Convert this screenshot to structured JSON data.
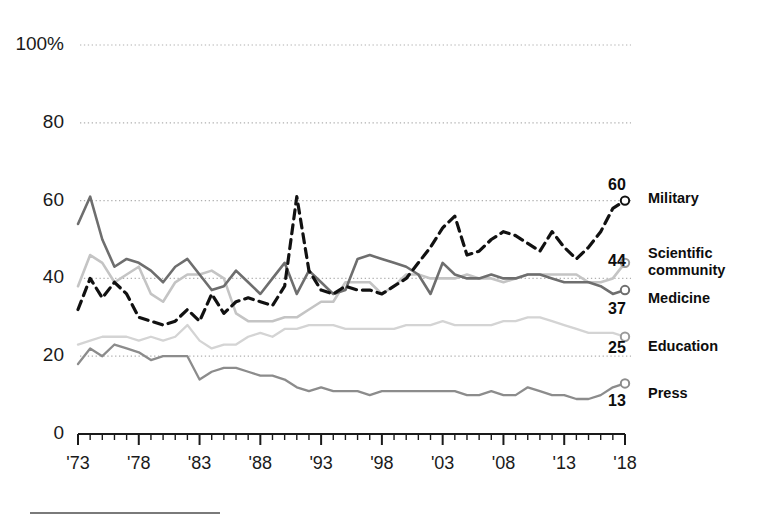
{
  "chart_data": {
    "type": "line",
    "title": "",
    "subtitle": "",
    "xlabel": "",
    "ylabel": "",
    "xlim": [
      1973,
      2018
    ],
    "ylim": [
      0,
      100
    ],
    "grid": true,
    "legend_position": "right-of-plot",
    "y_ticks": [
      "100%",
      "80",
      "60",
      "40",
      "20",
      "0"
    ],
    "y_tick_values": [
      100,
      80,
      60,
      40,
      20,
      0
    ],
    "x_ticks": [
      "'73",
      "'78",
      "'83",
      "'88",
      "'93",
      "'98",
      "'03",
      "'08",
      "'13",
      "'18"
    ],
    "x_tick_values": [
      1973,
      1978,
      1983,
      1988,
      1993,
      1998,
      2003,
      2008,
      2013,
      2018
    ],
    "x": [
      1973,
      1974,
      1975,
      1976,
      1977,
      1978,
      1979,
      1980,
      1981,
      1982,
      1983,
      1984,
      1985,
      1986,
      1987,
      1988,
      1989,
      1990,
      1991,
      1992,
      1993,
      1994,
      1995,
      1996,
      1997,
      1998,
      1999,
      2000,
      2001,
      2002,
      2003,
      2004,
      2005,
      2006,
      2007,
      2008,
      2009,
      2010,
      2011,
      2012,
      2013,
      2014,
      2015,
      2016,
      2017,
      2018
    ],
    "series": [
      {
        "name": "Military",
        "end_value": 60,
        "style": "dashed",
        "color": "#111111",
        "width": 3.2,
        "values": [
          32,
          40,
          35,
          39,
          36,
          30,
          29,
          28,
          29,
          32,
          29,
          36,
          31,
          34,
          35,
          34,
          33,
          38,
          61,
          42,
          37,
          36,
          38,
          37,
          37,
          36,
          38,
          40,
          44,
          48,
          53,
          56,
          46,
          47,
          50,
          52,
          51,
          49,
          47,
          52,
          48,
          45,
          48,
          52,
          58,
          60
        ]
      },
      {
        "name": "Scientific\ncommunity",
        "end_value": 44,
        "style": "solid",
        "color": "#c4c4c4",
        "width": 2.6,
        "values": [
          38,
          46,
          44,
          39,
          41,
          43,
          36,
          34,
          39,
          41,
          41,
          42,
          40,
          31,
          29,
          29,
          29,
          30,
          30,
          32,
          34,
          34,
          39,
          39,
          39,
          36,
          38,
          41,
          41,
          40,
          40,
          40,
          41,
          40,
          40,
          39,
          40,
          41,
          41,
          41,
          41,
          41,
          39,
          39,
          40,
          44
        ]
      },
      {
        "name": "Medicine",
        "end_value": 37,
        "style": "solid",
        "color": "#6e6e6e",
        "width": 2.6,
        "values": [
          54,
          61,
          50,
          43,
          45,
          44,
          42,
          39,
          43,
          45,
          41,
          37,
          38,
          42,
          39,
          36,
          40,
          44,
          36,
          42,
          39,
          36,
          37,
          45,
          46,
          45,
          44,
          43,
          41,
          36,
          44,
          41,
          40,
          40,
          41,
          40,
          40,
          41,
          41,
          40,
          39,
          39,
          39,
          38,
          36,
          37
        ]
      },
      {
        "name": "Education",
        "end_value": 25,
        "style": "solid",
        "color": "#d4d4d4",
        "width": 2.3,
        "values": [
          23,
          24,
          25,
          25,
          25,
          24,
          25,
          24,
          25,
          28,
          24,
          22,
          23,
          23,
          25,
          26,
          25,
          27,
          27,
          28,
          28,
          28,
          27,
          27,
          27,
          27,
          27,
          28,
          28,
          28,
          29,
          28,
          28,
          28,
          28,
          29,
          29,
          30,
          30,
          29,
          28,
          27,
          26,
          26,
          26,
          25
        ]
      },
      {
        "name": "Press",
        "end_value": 13,
        "style": "solid",
        "color": "#8c8c8c",
        "width": 2.3,
        "values": [
          18,
          22,
          20,
          23,
          22,
          21,
          19,
          20,
          20,
          20,
          14,
          16,
          17,
          17,
          16,
          15,
          15,
          14,
          12,
          11,
          12,
          11,
          11,
          11,
          10,
          11,
          11,
          11,
          11,
          11,
          11,
          11,
          10,
          10,
          11,
          10,
          10,
          12,
          11,
          10,
          10,
          9,
          9,
          10,
          12,
          13
        ]
      }
    ]
  },
  "axis": {
    "y_labels": [
      {
        "text": "100%",
        "value": 100
      },
      {
        "text": "80",
        "value": 80
      },
      {
        "text": "60",
        "value": 60
      },
      {
        "text": "40",
        "value": 40
      },
      {
        "text": "20",
        "value": 20
      },
      {
        "text": "0",
        "value": 0
      }
    ],
    "x_labels": [
      {
        "text": "'73",
        "value": 1973
      },
      {
        "text": "'78",
        "value": 1978
      },
      {
        "text": "'83",
        "value": 1983
      },
      {
        "text": "'88",
        "value": 1988
      },
      {
        "text": "'93",
        "value": 1993
      },
      {
        "text": "'98",
        "value": 1998
      },
      {
        "text": "'03",
        "value": 2003
      },
      {
        "text": "'08",
        "value": 2008
      },
      {
        "text": "'13",
        "value": 2013
      },
      {
        "text": "'18",
        "value": 2018
      }
    ]
  },
  "legend": [
    {
      "label": "Military",
      "value": "60"
    },
    {
      "label": "Scientific\ncommunity",
      "value": "44"
    },
    {
      "label": "Medicine",
      "value": "37"
    },
    {
      "label": "Education",
      "value": "25"
    },
    {
      "label": "Press",
      "value": "13"
    }
  ],
  "colors": {
    "military": "#111111",
    "scientific_community": "#c4c4c4",
    "medicine": "#6e6e6e",
    "education": "#d4d4d4",
    "press": "#8c8c8c",
    "grid": "#b0b0b0",
    "axis": "#1a1a1a",
    "text": "#0d0d0d"
  }
}
